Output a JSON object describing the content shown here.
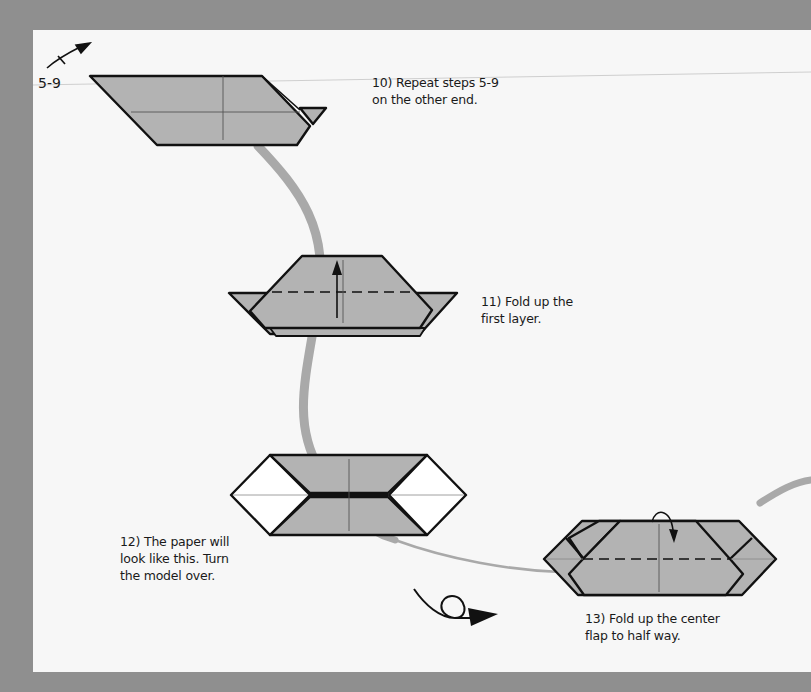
{
  "colors": {
    "background": "#8f8f8f",
    "paper": "#f7f7f7",
    "paper_gray": "#b3b3b3",
    "outline": "#111111",
    "connector": "#a9a9a9"
  },
  "reference": {
    "label": "5-9",
    "icon": "fold-repeat-arrow-icon"
  },
  "steps": [
    {
      "number": 10,
      "lines": [
        "10) Repeat steps 5-9",
        "on the other end."
      ]
    },
    {
      "number": 11,
      "lines": [
        "11) Fold up the",
        "first layer."
      ]
    },
    {
      "number": 12,
      "lines": [
        "12) The paper will",
        "look like this. Turn",
        "the model over."
      ]
    },
    {
      "number": 13,
      "lines": [
        "13) Fold up the center",
        "flap to half way."
      ]
    }
  ],
  "symbols": {
    "turn_over": "turn-over-arrow-icon",
    "fold_up": "fold-up-arrow-icon",
    "fold_center": "fold-over-arrow-icon"
  }
}
